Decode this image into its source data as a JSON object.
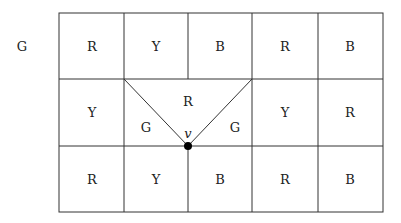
{
  "outside_label": "G",
  "rows": [
    [
      "R",
      "Y",
      "B",
      "R",
      "B"
    ],
    [
      "Y",
      "",
      "",
      "",
      "Y",
      "R"
    ],
    [
      "R",
      "Y",
      "B",
      "R",
      "B"
    ]
  ],
  "middle_region": {
    "top_label": "R",
    "left_label": "G",
    "right_label": "G",
    "vertex_label": "v"
  },
  "colors": {
    "line": "#333333",
    "text": "#222222",
    "vertex": "#000000"
  }
}
